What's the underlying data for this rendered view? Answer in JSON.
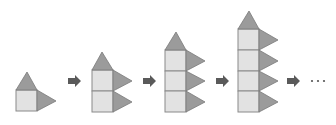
{
  "diagram": {
    "colors": {
      "square_fill": "#e2e2e2",
      "square_stroke": "#8a8a8a",
      "triangle_fill": "#9b9b9b",
      "arrow": "#5a5a5a"
    },
    "figures": [
      {
        "index": 1,
        "squares": 1,
        "side_triangles": 1,
        "top_triangles": 1
      },
      {
        "index": 2,
        "squares": 2,
        "side_triangles": 2,
        "top_triangles": 1
      },
      {
        "index": 3,
        "squares": 3,
        "side_triangles": 3,
        "top_triangles": 1
      },
      {
        "index": 4,
        "squares": 4,
        "side_triangles": 4,
        "top_triangles": 1
      }
    ],
    "continuation": "…"
  }
}
